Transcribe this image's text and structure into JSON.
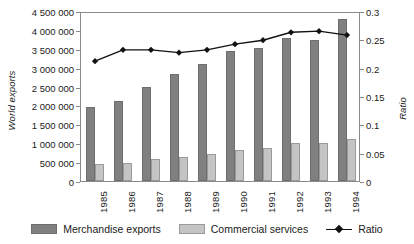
{
  "chart_data": {
    "type": "bar",
    "title": "",
    "xlabel": "",
    "ylabel": "World exports",
    "y2label": "Ratio",
    "categories": [
      "1985",
      "1986",
      "1987",
      "1988",
      "1989",
      "1990",
      "1991",
      "1992",
      "1993",
      "1994"
    ],
    "series": [
      {
        "name": "Merchandise exports",
        "type": "bar",
        "axis": "left",
        "color": "#808080",
        "values": [
          1950000,
          2110000,
          2490000,
          2830000,
          3100000,
          3440000,
          3520000,
          3780000,
          3730000,
          4290000
        ]
      },
      {
        "name": "Commercial services",
        "type": "bar",
        "axis": "left",
        "color": "#c4c4c4",
        "values": [
          440000,
          490000,
          580000,
          630000,
          720000,
          830000,
          870000,
          1000000,
          1000000,
          1100000
        ]
      },
      {
        "name": "Ratio",
        "type": "line",
        "axis": "right",
        "color": "#111111",
        "values": [
          0.215,
          0.235,
          0.235,
          0.23,
          0.235,
          0.245,
          0.252,
          0.266,
          0.268,
          0.261
        ]
      }
    ],
    "ylim": [
      0,
      4500000
    ],
    "yticks": [
      0,
      500000,
      1000000,
      1500000,
      2000000,
      2500000,
      3000000,
      3500000,
      4000000,
      4500000
    ],
    "ytick_labels": [
      "0",
      "500 000",
      "1 000 000",
      "1 500 000",
      "2 000 000",
      "2 500 000",
      "3 000 000",
      "3 500 000",
      "4 000 000",
      "4 500 000"
    ],
    "y2lim": [
      0,
      0.3
    ],
    "y2ticks": [
      0,
      0.05,
      0.1,
      0.15,
      0.2,
      0.25,
      0.3
    ],
    "y2tick_labels": [
      "0",
      "0.05",
      "0.1",
      "0.15",
      "0.2",
      "0.25",
      "0.3"
    ],
    "grid": false,
    "legend_position": "bottom",
    "legend": [
      "Merchandise exports",
      "Commercial services",
      "Ratio"
    ]
  }
}
